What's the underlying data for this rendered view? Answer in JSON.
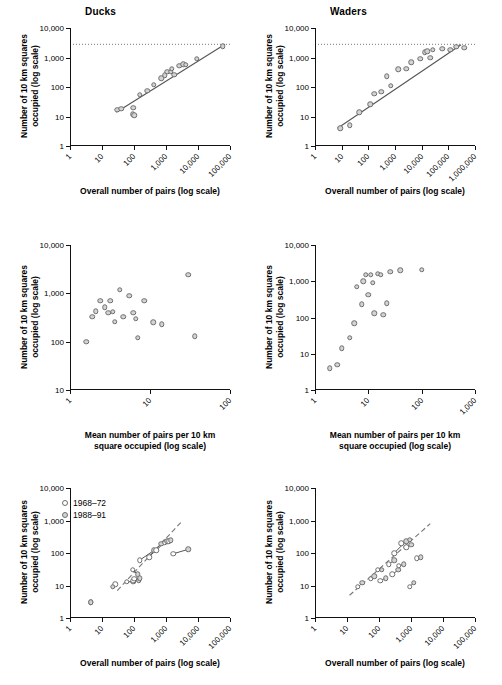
{
  "figure": {
    "axis_labels": {
      "y_squares": "Number of 10 km squares\noccupied (log scale)",
      "x_pairs": "Overall number of pairs (log scale)",
      "x_mean": "Mean number of pairs per 10 km\nsquare occupied (log scale)"
    },
    "legend": {
      "items": [
        {
          "label": "1968–72",
          "style": "open"
        },
        {
          "label": "1988–91",
          "style": "filled"
        }
      ]
    },
    "colors": {
      "marker_fill": "#d3d3d3",
      "marker_edge": "#6e6e6e",
      "line": "#555555",
      "axis": "#111111",
      "reference_line": "#777777"
    }
  },
  "chart_data": [
    {
      "id": "panel-a",
      "type": "scatter",
      "title": "Ducks",
      "xlabel": "Overall number of pairs (log scale)",
      "ylabel": "Number of 10 km squares occupied (log scale)",
      "xlim": [
        1,
        100000
      ],
      "ylim": [
        1,
        10000
      ],
      "xticks": [
        "1",
        "10",
        "100",
        "1,000",
        "10,000",
        "100,000"
      ],
      "yticks": [
        "1",
        "10",
        "100",
        "1,000",
        "10,000"
      ],
      "grid": false,
      "points": [
        {
          "x": 30,
          "y": 17
        },
        {
          "x": 40,
          "y": 18
        },
        {
          "x": 90,
          "y": 12
        },
        {
          "x": 95,
          "y": 20
        },
        {
          "x": 100,
          "y": 11
        },
        {
          "x": 150,
          "y": 55
        },
        {
          "x": 260,
          "y": 75
        },
        {
          "x": 420,
          "y": 120
        },
        {
          "x": 700,
          "y": 200
        },
        {
          "x": 900,
          "y": 250
        },
        {
          "x": 1100,
          "y": 330
        },
        {
          "x": 1400,
          "y": 330
        },
        {
          "x": 1500,
          "y": 420
        },
        {
          "x": 1800,
          "y": 260
        },
        {
          "x": 2600,
          "y": 520
        },
        {
          "x": 3400,
          "y": 600
        },
        {
          "x": 4200,
          "y": 560
        },
        {
          "x": 9000,
          "y": 900
        },
        {
          "x": 60000,
          "y": 2400
        }
      ],
      "fit_line": {
        "x0": 28,
        "y0": 14,
        "x1": 70000,
        "y1": 2800
      },
      "reference_line": {
        "y": 2800,
        "style": "dotted"
      }
    },
    {
      "id": "panel-b",
      "type": "scatter",
      "title": "Waders",
      "xlabel": "Overall number of pairs (log scale)",
      "ylabel": "Number of 10 km squares occupied (log scale)",
      "xlim": [
        1,
        1000000
      ],
      "ylim": [
        1,
        10000
      ],
      "xticks": [
        "1",
        "10",
        "100",
        "1,000",
        "10,000",
        "100,000",
        "1,000,000"
      ],
      "yticks": [
        "1",
        "10",
        "100",
        "1,000",
        "10,000"
      ],
      "grid": false,
      "points": [
        {
          "x": 9,
          "y": 4
        },
        {
          "x": 20,
          "y": 5
        },
        {
          "x": 45,
          "y": 14
        },
        {
          "x": 120,
          "y": 26
        },
        {
          "x": 170,
          "y": 60
        },
        {
          "x": 300,
          "y": 70
        },
        {
          "x": 500,
          "y": 230
        },
        {
          "x": 700,
          "y": 110
        },
        {
          "x": 1300,
          "y": 400
        },
        {
          "x": 2600,
          "y": 420
        },
        {
          "x": 4000,
          "y": 700
        },
        {
          "x": 9000,
          "y": 900
        },
        {
          "x": 13000,
          "y": 1500
        },
        {
          "x": 16000,
          "y": 1600
        },
        {
          "x": 21000,
          "y": 1000
        },
        {
          "x": 26000,
          "y": 1800
        },
        {
          "x": 60000,
          "y": 2000
        },
        {
          "x": 120000,
          "y": 1800
        },
        {
          "x": 200000,
          "y": 2300
        },
        {
          "x": 400000,
          "y": 2100
        }
      ],
      "fit_line": {
        "x0": 7,
        "y0": 4,
        "x1": 300000,
        "y1": 2700
      },
      "reference_line": {
        "y": 2800,
        "style": "dotted"
      }
    },
    {
      "id": "panel-c",
      "type": "scatter",
      "title": "",
      "xlabel": "Mean number of pairs per 10 km square occupied (log scale)",
      "ylabel": "Number of 10 km squares occupied (log scale)",
      "xlim": [
        1,
        100
      ],
      "ylim": [
        10,
        10000
      ],
      "xticks": [
        "1",
        "10",
        "100"
      ],
      "yticks": [
        "10",
        "100",
        "1,000",
        "10,000"
      ],
      "grid": false,
      "points": [
        {
          "x": 1.6,
          "y": 100
        },
        {
          "x": 1.9,
          "y": 330
        },
        {
          "x": 2.1,
          "y": 430
        },
        {
          "x": 2.4,
          "y": 700
        },
        {
          "x": 2.7,
          "y": 520
        },
        {
          "x": 3.0,
          "y": 400
        },
        {
          "x": 3.2,
          "y": 700
        },
        {
          "x": 3.4,
          "y": 420
        },
        {
          "x": 3.6,
          "y": 260
        },
        {
          "x": 4.2,
          "y": 1200
        },
        {
          "x": 4.6,
          "y": 330
        },
        {
          "x": 5.5,
          "y": 900
        },
        {
          "x": 6.2,
          "y": 400
        },
        {
          "x": 6.6,
          "y": 300
        },
        {
          "x": 7.0,
          "y": 120
        },
        {
          "x": 8.5,
          "y": 700
        },
        {
          "x": 11,
          "y": 250
        },
        {
          "x": 14,
          "y": 230
        },
        {
          "x": 30,
          "y": 2400
        },
        {
          "x": 36,
          "y": 130
        }
      ]
    },
    {
      "id": "panel-d",
      "type": "scatter",
      "title": "",
      "xlabel": "Mean number of pairs per 10 km square occupied (log scale)",
      "ylabel": "Number of 10 km squares occupied (log scale)",
      "xlim": [
        1,
        1000
      ],
      "ylim": [
        1,
        10000
      ],
      "xticks": [
        "1",
        "10",
        "100",
        "1,000"
      ],
      "yticks": [
        "1",
        "10",
        "100",
        "1,000",
        "10,000"
      ],
      "grid": false,
      "points": [
        {
          "x": 1.9,
          "y": 4
        },
        {
          "x": 2.6,
          "y": 5
        },
        {
          "x": 3.2,
          "y": 14
        },
        {
          "x": 4.5,
          "y": 28
        },
        {
          "x": 5.5,
          "y": 70
        },
        {
          "x": 6.0,
          "y": 700
        },
        {
          "x": 7.5,
          "y": 230
        },
        {
          "x": 8.0,
          "y": 1000
        },
        {
          "x": 9.0,
          "y": 1500
        },
        {
          "x": 10,
          "y": 420
        },
        {
          "x": 11,
          "y": 1500
        },
        {
          "x": 12,
          "y": 900
        },
        {
          "x": 13,
          "y": 130
        },
        {
          "x": 15,
          "y": 1600
        },
        {
          "x": 17,
          "y": 1500
        },
        {
          "x": 19,
          "y": 120
        },
        {
          "x": 22,
          "y": 250
        },
        {
          "x": 26,
          "y": 1800
        },
        {
          "x": 40,
          "y": 2000
        },
        {
          "x": 100,
          "y": 2100
        }
      ]
    },
    {
      "id": "panel-e",
      "type": "scatter",
      "title": "",
      "xlabel": "Overall number of pairs (log scale)",
      "ylabel": "Number of 10 km squares occupied (log scale)",
      "xlim": [
        1,
        100000
      ],
      "ylim": [
        1,
        10000
      ],
      "xticks": [
        "1",
        "10",
        "100",
        "1,000",
        "10,000",
        "100,000"
      ],
      "yticks": [
        "1",
        "10",
        "100",
        "1,000",
        "10,000"
      ],
      "grid": false,
      "reference_line": {
        "x0": 30,
        "y0": 7,
        "x1": 3000,
        "y1": 900,
        "style": "dashed"
      },
      "pairs": [
        {
          "open": {
            "x": 4.5,
            "y": 3
          },
          "filled": {
            "x": 4.5,
            "y": 3
          }
        },
        {
          "open": {
            "x": 26,
            "y": 11
          },
          "filled": {
            "x": 22,
            "y": 9
          }
        },
        {
          "open": {
            "x": 60,
            "y": 13
          },
          "filled": {
            "x": 95,
            "y": 13
          }
        },
        {
          "open": {
            "x": 90,
            "y": 30
          },
          "filled": {
            "x": 130,
            "y": 22
          }
        },
        {
          "open": {
            "x": 95,
            "y": 14
          },
          "filled": {
            "x": 140,
            "y": 14
          }
        },
        {
          "open": {
            "x": 100,
            "y": 16
          },
          "filled": {
            "x": 150,
            "y": 17
          }
        },
        {
          "open": {
            "x": 150,
            "y": 60
          },
          "filled": {
            "x": 420,
            "y": 120
          }
        },
        {
          "open": {
            "x": 300,
            "y": 75
          },
          "filled": {
            "x": 700,
            "y": 190
          }
        },
        {
          "open": {
            "x": 500,
            "y": 120
          },
          "filled": {
            "x": 900,
            "y": 220
          }
        },
        {
          "open": {
            "x": 900,
            "y": 210
          },
          "filled": {
            "x": 1100,
            "y": 230
          }
        },
        {
          "open": {
            "x": 1200,
            "y": 230
          },
          "filled": {
            "x": 1400,
            "y": 250
          }
        },
        {
          "open": {
            "x": 1700,
            "y": 95
          },
          "filled": {
            "x": 5000,
            "y": 130
          }
        }
      ]
    },
    {
      "id": "panel-f",
      "type": "scatter",
      "title": "",
      "xlabel": "Overall number of pairs (log scale)",
      "ylabel": "Number of 10 km squares occupied (log scale)",
      "xlim": [
        1,
        100000
      ],
      "ylim": [
        1,
        10000
      ],
      "xticks": [
        "1",
        "10",
        "100",
        "1,000",
        "10,000",
        "100,000"
      ],
      "yticks": [
        "1",
        "10",
        "100",
        "1,000",
        "10,000"
      ],
      "grid": false,
      "reference_line": {
        "x0": 12,
        "y0": 5,
        "x1": 4000,
        "y1": 800,
        "style": "dashed"
      },
      "pairs": [
        {
          "open": {
            "x": 22,
            "y": 9
          },
          "filled": {
            "x": 30,
            "y": 12
          }
        },
        {
          "open": {
            "x": 55,
            "y": 16
          },
          "filled": {
            "x": 70,
            "y": 19
          }
        },
        {
          "open": {
            "x": 90,
            "y": 30
          },
          "filled": {
            "x": 120,
            "y": 30
          }
        },
        {
          "open": {
            "x": 110,
            "y": 14
          },
          "filled": {
            "x": 160,
            "y": 17
          }
        },
        {
          "open": {
            "x": 200,
            "y": 45
          },
          "filled": {
            "x": 300,
            "y": 60
          }
        },
        {
          "open": {
            "x": 260,
            "y": 22
          },
          "filled": {
            "x": 400,
            "y": 30
          }
        },
        {
          "open": {
            "x": 300,
            "y": 100
          },
          "filled": {
            "x": 700,
            "y": 230
          }
        },
        {
          "open": {
            "x": 420,
            "y": 40
          },
          "filled": {
            "x": 600,
            "y": 45
          }
        },
        {
          "open": {
            "x": 500,
            "y": 200
          },
          "filled": {
            "x": 900,
            "y": 260
          }
        },
        {
          "open": {
            "x": 700,
            "y": 150
          },
          "filled": {
            "x": 1000,
            "y": 180
          }
        },
        {
          "open": {
            "x": 900,
            "y": 9
          },
          "filled": {
            "x": 1200,
            "y": 12
          }
        },
        {
          "open": {
            "x": 1500,
            "y": 70
          },
          "filled": {
            "x": 2000,
            "y": 75
          }
        }
      ]
    }
  ]
}
